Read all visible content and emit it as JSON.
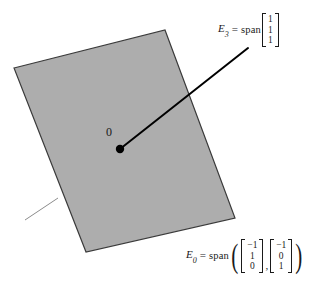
{
  "figure": {
    "type": "linear-algebra-eigenspace-diagram",
    "background_color": "#ffffff",
    "plane": {
      "name": "eigenspace-plane",
      "fill_color": "#adadad",
      "stroke_color": "#3a3a3a",
      "corners": [
        [
          14,
          68
        ],
        [
          165,
          30
        ],
        [
          235,
          218
        ],
        [
          86,
          252
        ]
      ]
    },
    "origin": {
      "label": "0",
      "dot_color": "#000000",
      "position": [
        120,
        149
      ]
    },
    "leader_line": {
      "name": "eigenvector-line",
      "color": "#000000",
      "from": [
        120,
        149
      ],
      "to": [
        248,
        48
      ]
    },
    "edge_tick": {
      "name": "plane-edge-tick",
      "color": "#8c8c8c",
      "from": [
        25,
        220
      ],
      "to": [
        58,
        198
      ]
    }
  },
  "labels": {
    "origin": "0",
    "e3": {
      "symbol": "E",
      "subscript": "3",
      "equals": "=",
      "operator": "span",
      "vectors": [
        {
          "entries": [
            "1",
            "1",
            "1"
          ]
        }
      ]
    },
    "e0": {
      "symbol": "E",
      "subscript": "0",
      "equals": "=",
      "operator": "span",
      "open_paren": "(",
      "close_paren": ")",
      "separator": ",",
      "vectors": [
        {
          "entries": [
            "−1",
            "1",
            "0"
          ]
        },
        {
          "entries": [
            "−1",
            "0",
            "1"
          ]
        }
      ]
    }
  }
}
